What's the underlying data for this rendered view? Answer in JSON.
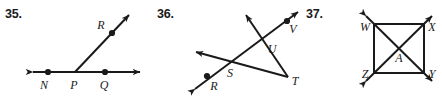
{
  "page": {
    "width": 442,
    "height": 103,
    "background": "#ffffff",
    "ink_color": "#1a1a1a"
  },
  "figures": [
    {
      "number": "35.",
      "name": "figure-35",
      "description": "A line with arrowheads at both ends containing points N, P, Q, and a ray from P through R",
      "point_labels": [
        "N",
        "P",
        "Q",
        "R"
      ],
      "labels": {
        "N": "N",
        "P": "P",
        "Q": "Q",
        "R": "R"
      },
      "geometry": {
        "line_NQ": {
          "x1": 28,
          "y1": 72,
          "x2": 145,
          "y2": 72,
          "arrows": "both"
        },
        "ray_PR": {
          "x1": 75,
          "y1": 72,
          "x2": 133,
          "y2": 11,
          "arrows": "end"
        },
        "dots": [
          {
            "label": "N",
            "x": 48,
            "y": 72
          },
          {
            "label": "P",
            "x": 75,
            "y": 72
          },
          {
            "label": "Q",
            "x": 105,
            "y": 72
          },
          {
            "label": "R",
            "x": 112,
            "y": 33
          }
        ],
        "label_positions": [
          {
            "label": "N",
            "x": 44,
            "y": 88
          },
          {
            "label": "P",
            "x": 71,
            "y": 88
          },
          {
            "label": "Q",
            "x": 101,
            "y": 88
          },
          {
            "label": "R",
            "x": 100,
            "y": 28
          }
        ]
      }
    },
    {
      "number": "36.",
      "name": "figure-36",
      "description": "Two lines crossing a ray forming points R, S, U, V with vertex T",
      "point_labels": [
        "R",
        "S",
        "T",
        "U",
        "V"
      ],
      "labels": {
        "R": "R",
        "S": "S",
        "T": "T",
        "U": "U",
        "V": "V"
      },
      "geometry": {
        "line_RV": {
          "x1": 40,
          "y1": 92,
          "x2": 152,
          "y2": 8,
          "arrows": "both"
        },
        "ray_TS": {
          "x1": 138,
          "y1": 77,
          "x2": 41,
          "y2": 51,
          "arrows": "end"
        },
        "ray_TU": {
          "x1": 138,
          "y1": 77,
          "x2": 93,
          "y2": 10,
          "arrows": "end"
        },
        "dots": [
          {
            "label": "R",
            "x": 57,
            "y": 76
          },
          {
            "label": "V",
            "x": 137,
            "y": 21
          }
        ],
        "label_positions": [
          {
            "label": "R",
            "x": 63,
            "y": 88
          },
          {
            "label": "S",
            "x": 80,
            "y": 76
          },
          {
            "label": "T",
            "x": 142,
            "y": 84
          },
          {
            "label": "U",
            "x": 120,
            "y": 51
          },
          {
            "label": "V",
            "x": 142,
            "y": 32
          }
        ],
        "intersections": [
          {
            "label": "S",
            "x": 78,
            "y": 62
          },
          {
            "label": "U",
            "x": 118,
            "y": 43
          }
        ]
      }
    },
    {
      "number": "37.",
      "name": "figure-37",
      "description": "A square WXYZ with both diagonals drawn crossing at center A, diagonals extended with arrowheads beyond each corner",
      "point_labels": [
        "W",
        "X",
        "Y",
        "Z",
        "A"
      ],
      "labels": {
        "W": "W",
        "X": "X",
        "Y": "Y",
        "Z": "Z",
        "A": "A"
      },
      "geometry": {
        "square": {
          "x": 79,
          "y": 24,
          "width": 50,
          "height": 49
        },
        "corners": {
          "W": {
            "x": 79,
            "y": 24
          },
          "X": {
            "x": 129,
            "y": 24
          },
          "Y": {
            "x": 129,
            "y": 73
          },
          "Z": {
            "x": 79,
            "y": 73
          }
        },
        "center": {
          "label": "A",
          "x": 104,
          "y": 48
        },
        "diagonal_WY": {
          "x1": 66,
          "y1": 11,
          "x2": 142,
          "y2": 86,
          "arrows": "both"
        },
        "diagonal_ZX": {
          "x1": 66,
          "y1": 86,
          "x2": 142,
          "y2": 11,
          "arrows": "both"
        },
        "label_positions": [
          {
            "label": "W",
            "x": 63,
            "y": 30
          },
          {
            "label": "X",
            "x": 133,
            "y": 30
          },
          {
            "label": "Y",
            "x": 133,
            "y": 77
          },
          {
            "label": "Z",
            "x": 63,
            "y": 77
          },
          {
            "label": "A",
            "x": 103,
            "y": 61
          }
        ]
      }
    }
  ]
}
